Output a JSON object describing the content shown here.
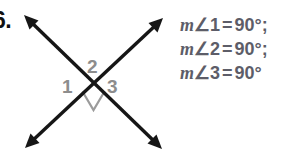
{
  "problem": {
    "number_label": "6."
  },
  "figure": {
    "name": "two-intersecting-lines-perpendicular",
    "line_color": "#161616",
    "label_color": "#8d8d8d",
    "right_angle_marker": "right-angle-square",
    "angle_labels": [
      {
        "id": "1",
        "text": "1"
      },
      {
        "id": "2",
        "text": "2"
      },
      {
        "id": "3",
        "text": "3"
      }
    ],
    "arrows": [
      {
        "name": "arrow-up-left"
      },
      {
        "name": "arrow-down-right"
      },
      {
        "name": "arrow-up-right"
      },
      {
        "name": "arrow-down-left"
      }
    ]
  },
  "equations": {
    "text_color": "#5d5d68",
    "lines": [
      {
        "m": "m",
        "angle_symbol": "∠",
        "index": "1",
        "equals": "=",
        "value": "90°;"
      },
      {
        "m": "m",
        "angle_symbol": "∠",
        "index": "2",
        "equals": "=",
        "value": "90°;"
      },
      {
        "m": "m",
        "angle_symbol": "∠",
        "index": "3",
        "equals": "=",
        "value": "90°"
      }
    ]
  }
}
